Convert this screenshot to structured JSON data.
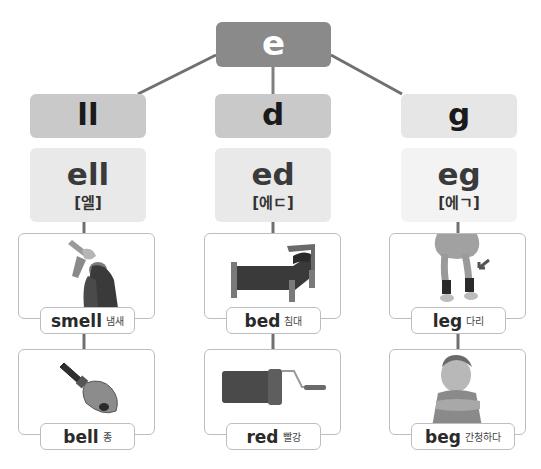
{
  "colors": {
    "root_bg": "#8a8a8a",
    "suffix_ll_bg": "#c9c9c9",
    "suffix_d_bg": "#c9c9c9",
    "suffix_g_bg": "#e6e6e6",
    "rime_ll_bg": "#e9e9e9",
    "rime_d_bg": "#e9e9e9",
    "rime_g_bg": "#f3f3f3",
    "rope": "#7a7a7a"
  },
  "root": {
    "label": "e"
  },
  "columns": [
    {
      "suffix": "ll",
      "rime": "ell",
      "pronunciation": "[엘]",
      "words": [
        {
          "en": "smell",
          "ko": "냄새",
          "icon": "woman-smelling-flowers-image"
        },
        {
          "en": "bell",
          "ko": "종",
          "icon": "hand-bell-image"
        }
      ]
    },
    {
      "suffix": "d",
      "rime": "ed",
      "pronunciation": "[에ㄷ]",
      "words": [
        {
          "en": "bed",
          "ko": "침대",
          "icon": "bed-image"
        },
        {
          "en": "red",
          "ko": "빨강",
          "icon": "red-paint-roller-image"
        }
      ]
    },
    {
      "suffix": "g",
      "rime": "eg",
      "pronunciation": "[에ㄱ]",
      "words": [
        {
          "en": "leg",
          "ko": "다리",
          "icon": "legs-with-arrow-image"
        },
        {
          "en": "beg",
          "ko": "간청하다",
          "icon": "child-begging-image"
        }
      ]
    }
  ]
}
